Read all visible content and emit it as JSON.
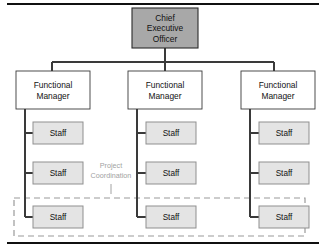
{
  "diagram": {
    "type": "organizational-chart",
    "variant": "matrix-organization",
    "canvas": {
      "width": 326,
      "height": 252,
      "background": "#ffffff"
    },
    "colors": {
      "executive_fill": "#a8a8a8",
      "manager_fill": "#ffffff",
      "staff_fill": "#e4e4e4",
      "box_stroke": "#3a3a3a",
      "executive_stroke": "#2b2b2b",
      "staff_stroke": "#8f8f8f",
      "connector": "#3a3a3a",
      "dashed_region": "#9a9a9a",
      "annotation_text": "#a2a2a2",
      "rule": "#101010"
    },
    "rules": {
      "top": {
        "x1": 7,
        "y": 4,
        "x2": 319
      },
      "bottom": {
        "x1": 7,
        "y": 243,
        "x2": 319
      }
    },
    "executive": {
      "label_lines": [
        "Chief",
        "Executive",
        "Officer"
      ],
      "box": {
        "x": 132,
        "y": 8,
        "w": 66,
        "h": 40
      }
    },
    "bus": {
      "stem": {
        "x": 165,
        "y1": 48,
        "y2": 62
      },
      "rail": {
        "y": 62,
        "x1": 52,
        "x2": 274
      }
    },
    "managers": [
      {
        "label_lines": [
          "Functional",
          "Manager"
        ],
        "box": {
          "x": 16,
          "y": 71,
          "w": 74,
          "h": 38
        },
        "drop_x": 52,
        "trunk_x": 25
      },
      {
        "label_lines": [
          "Functional",
          "Manager"
        ],
        "box": {
          "x": 128,
          "y": 71,
          "w": 74,
          "h": 38
        },
        "drop_x": 165,
        "trunk_x": 137
      },
      {
        "label_lines": [
          "Functional",
          "Manager"
        ],
        "box": {
          "x": 241,
          "y": 71,
          "w": 74,
          "h": 38
        },
        "drop_x": 274,
        "trunk_x": 250
      }
    ],
    "staff_rows": [
      {
        "y": 122,
        "h": 22
      },
      {
        "y": 162,
        "h": 22
      },
      {
        "y": 206,
        "h": 22
      }
    ],
    "staff": {
      "label": "Staff",
      "width": 50,
      "columns": [
        {
          "x": 33,
          "cells": [
            "Staff",
            "Staff",
            "Staff"
          ]
        },
        {
          "x": 146,
          "cells": [
            "Staff",
            "Staff",
            "Staff"
          ]
        },
        {
          "x": 259,
          "cells": [
            "Staff",
            "Staff",
            "Staff"
          ]
        }
      ]
    },
    "project_region": {
      "box": {
        "x": 14,
        "y": 198,
        "w": 291,
        "h": 38
      },
      "style": "dashed"
    },
    "annotation": {
      "label_lines": [
        "Project",
        "Coordination"
      ],
      "x": 111,
      "line1_y": 168,
      "line2_y": 178,
      "tick": {
        "x": 111,
        "y1": 184,
        "y2": 194
      }
    }
  }
}
